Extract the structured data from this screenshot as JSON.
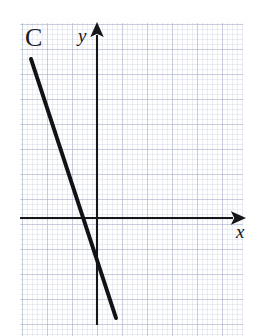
{
  "figure": {
    "label": "C",
    "background": "#ffffff",
    "grid_color": "#a8b0c9",
    "ink_color": "#15161a",
    "width": 260,
    "height": 336
  },
  "axes": {
    "x_label": "x",
    "y_label": "y",
    "x_axis": {
      "x1": 20,
      "y1": 218,
      "x2": 240,
      "y2": 218,
      "arrow": "right"
    },
    "y_axis": {
      "x1": 97,
      "y1": 28,
      "x2": 97,
      "y2": 325,
      "arrow": "up"
    },
    "origin": {
      "x": 97,
      "y": 218
    }
  },
  "grid": {
    "left": 20,
    "top": 23,
    "width": 223,
    "height": 313,
    "minor_cell_px": 5,
    "major_cell_px": 25
  },
  "chart_data": {
    "type": "line",
    "title": "C",
    "xlabel": "x",
    "ylabel": "y",
    "grid": true,
    "legend": false,
    "series": [
      {
        "name": "C",
        "points_px": [
          [
            31,
            59
          ],
          [
            116,
            318
          ]
        ],
        "x_intercept_px": 84,
        "y_intercept_px": 258,
        "slope_sign": "negative",
        "slope_px_per_px": -3.05,
        "stroke": "#111216",
        "stroke_width_px": 4
      }
    ],
    "x_intercept_units": -0.52,
    "y_intercept_units": -1.6,
    "slope_units": -3.05,
    "unit_px": 25,
    "xlim_units": [
      -3.08,
      5.84
    ],
    "ylim_units": [
      -4.28,
      7.8
    ]
  }
}
